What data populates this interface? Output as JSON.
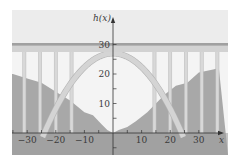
{
  "figure": {
    "function_label": "h(x)",
    "x_axis_label": "x",
    "x_ticks": [
      -30,
      -20,
      -10,
      10,
      20,
      30
    ],
    "y_ticks": [
      10,
      20,
      30
    ],
    "x_minor_ticks": [
      -35,
      -30,
      -25,
      -20,
      -15,
      -10,
      -5,
      5,
      10,
      15,
      20,
      25,
      30
    ],
    "y_minor_ticks": [
      -5,
      5,
      10,
      15,
      20,
      25,
      30
    ],
    "colors": {
      "panel": "#ececec",
      "sky": "#f4f4f4",
      "terrain": "#a8a8a8",
      "terrain_dark": "#9a9a9a",
      "deck_band": "#d2d2d2",
      "deck_line": "#a0a0a0",
      "pillar": "#d8d8d8",
      "pillar_edge": "#b8b8b8",
      "arch": "#d4d4d4",
      "arch_edge": "#b4b4b4",
      "axis": "#333333"
    }
  },
  "chart_data": {
    "type": "line",
    "title": "",
    "xlabel": "x",
    "ylabel": "h(x)",
    "xlim": [
      -35,
      37
    ],
    "ylim": [
      -7,
      40
    ],
    "grid": false,
    "series": [
      {
        "name": "arch h(x) (parabola)",
        "vertex": [
          0,
          27
        ],
        "roots": [
          -24,
          24
        ],
        "x": [
          -24,
          -20,
          -15,
          -10,
          -5,
          0,
          5,
          10,
          15,
          20,
          24
        ],
        "values": [
          0,
          8.25,
          16.5,
          22.3,
          25.8,
          27,
          25.8,
          22.3,
          16.5,
          8.25,
          0
        ]
      },
      {
        "name": "deck",
        "x": [
          -35,
          37
        ],
        "values": [
          30,
          30
        ]
      },
      {
        "name": "terrain",
        "x": [
          -35,
          -30,
          -25,
          -20,
          -15,
          -10,
          -7,
          -4,
          -2,
          0,
          2,
          5,
          8,
          12,
          15,
          18,
          22,
          26,
          30,
          35,
          37
        ],
        "values": [
          20,
          18.5,
          17,
          14,
          11,
          7,
          6,
          3,
          1,
          0,
          1,
          2,
          4,
          7,
          10,
          13,
          16,
          17,
          20.5,
          21.5,
          22
        ]
      }
    ],
    "pillars_x": [
      -31,
      -25.5,
      -20,
      -14.5,
      14.5,
      20,
      25.5,
      31,
      36.5
    ],
    "x_tick_labels": [
      "-30",
      "-20",
      "-10",
      "10",
      "20",
      "30"
    ],
    "y_tick_labels": [
      "10",
      "20",
      "30"
    ]
  }
}
